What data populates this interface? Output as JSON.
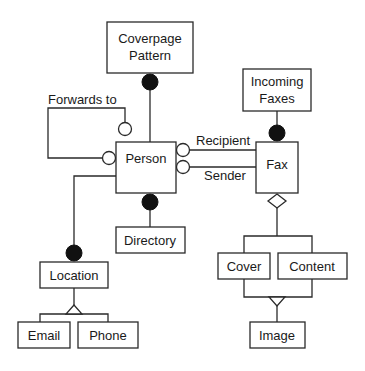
{
  "diagram": {
    "type": "object-model",
    "entities": {
      "coverpage_pattern": {
        "line1": "Coverpage",
        "line2": "Pattern"
      },
      "person": {
        "label": "Person"
      },
      "incoming_faxes": {
        "line1": "Incoming",
        "line2": "Faxes"
      },
      "fax": {
        "label": "Fax"
      },
      "directory": {
        "label": "Directory"
      },
      "location": {
        "label": "Location"
      },
      "email": {
        "label": "Email"
      },
      "phone": {
        "label": "Phone"
      },
      "cover": {
        "label": "Cover"
      },
      "content": {
        "label": "Content"
      },
      "image": {
        "label": "Image"
      }
    },
    "relationships": {
      "forwards_to": {
        "label": "Forwards to",
        "from": "Person",
        "to": "Person",
        "end": "open-circle"
      },
      "recipient": {
        "label": "Recipient",
        "from": "Fax",
        "to": "Person",
        "end": "open-circle"
      },
      "sender": {
        "label": "Sender",
        "from": "Fax",
        "to": "Person",
        "end": "open-circle"
      },
      "coverpage": {
        "from": "Coverpage Pattern",
        "to": "Person",
        "end": "filled-circle"
      },
      "incoming": {
        "from": "Incoming Faxes",
        "to": "Fax",
        "end": "filled-circle"
      },
      "directory": {
        "from": "Person",
        "to": "Directory",
        "end": "filled-circle"
      },
      "location": {
        "from": "Person",
        "to": "Location",
        "end": "filled-circle"
      },
      "location_generalization": {
        "parent": "Location",
        "children": [
          "Email",
          "Phone"
        ],
        "symbol": "triangle"
      },
      "fax_aggregation": {
        "whole": "Fax",
        "parts": [
          "Cover",
          "Content"
        ],
        "symbol": "diamond"
      },
      "image_generalization": {
        "parent": "Image",
        "children": [
          "Cover",
          "Content"
        ],
        "symbol": "triangle"
      }
    }
  }
}
